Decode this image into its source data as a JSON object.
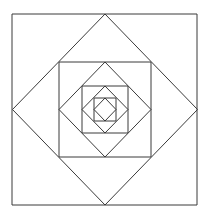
{
  "diagram": {
    "stroke_color": "#3a3a3a",
    "background": "#ffffff",
    "shapes": [
      {
        "type": "square",
        "x1": 12,
        "y1": 14,
        "x2": 197,
        "y2": 205
      },
      {
        "type": "diamond",
        "cx": 105,
        "cy": 109.5,
        "rx": 92.5,
        "ry": 95.5
      },
      {
        "type": "square",
        "x1": 59,
        "y1": 62,
        "x2": 151,
        "y2": 157
      },
      {
        "type": "diamond",
        "cx": 105,
        "cy": 109.5,
        "rx": 46,
        "ry": 47.5
      },
      {
        "type": "square",
        "x1": 82,
        "y1": 86,
        "x2": 128,
        "y2": 133
      },
      {
        "type": "diamond",
        "cx": 105,
        "cy": 109.5,
        "rx": 23,
        "ry": 23.5
      },
      {
        "type": "square",
        "x1": 94,
        "y1": 98,
        "x2": 116,
        "y2": 121
      },
      {
        "type": "diamond",
        "cx": 105,
        "cy": 109.5,
        "rx": 11,
        "ry": 11.5
      }
    ]
  }
}
